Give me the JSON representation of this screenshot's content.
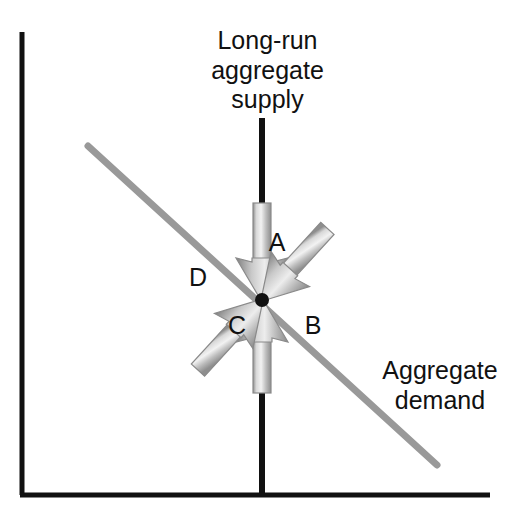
{
  "figure": {
    "background_color": "#ffffff",
    "width": 524,
    "height": 527
  },
  "axes": {
    "color": "#111111",
    "vertical": {
      "x": 22,
      "y_top": 32,
      "y_bottom": 495
    },
    "horizontal": {
      "y": 495,
      "x_left": 22,
      "x_right": 490
    }
  },
  "curves": {
    "lras": {
      "name": "long-run-aggregate-supply",
      "label": "Long-run\naggregate\nsupply",
      "label_line1": "Long-run",
      "label_line2": "aggregate",
      "label_line3": "supply",
      "color": "#111111",
      "x": 262,
      "y_top": 118,
      "y_bottom": 495,
      "stroke_width": 6
    },
    "aggregate_demand": {
      "name": "aggregate-demand",
      "label": "Aggregate\ndemand",
      "label_line1": "Aggregate",
      "label_line2": "demand",
      "color": "#999999",
      "x1": 88,
      "y1": 146,
      "x2": 437,
      "y2": 465,
      "stroke_width": 7
    }
  },
  "equilibrium_point": {
    "name": "equilibrium-dot",
    "x": 262,
    "y": 300,
    "radius": 7,
    "color": "#111111"
  },
  "arrows": [
    {
      "id": "A",
      "label": "A",
      "description": "downward arrow along long-run aggregate supply",
      "tail_x": 262,
      "tail_y": 205,
      "head_x": 262,
      "head_y": 300,
      "color": "#a8a8a8"
    },
    {
      "id": "B",
      "label": "B",
      "description": "up-left arrow along aggregate demand",
      "tail_x": 338,
      "tail_y": 366,
      "head_x": 262,
      "head_y": 300,
      "color": "#a8a8a8"
    },
    {
      "id": "C",
      "label": "C",
      "description": "upward arrow along long-run aggregate supply",
      "tail_x": 262,
      "tail_y": 392,
      "head_x": 262,
      "head_y": 300,
      "color": "#a8a8a8"
    },
    {
      "id": "D",
      "label": "D",
      "description": "down-right arrow along aggregate demand",
      "tail_x": 188,
      "tail_y": 232,
      "head_x": 262,
      "head_y": 300,
      "color": "#a8a8a8"
    }
  ]
}
